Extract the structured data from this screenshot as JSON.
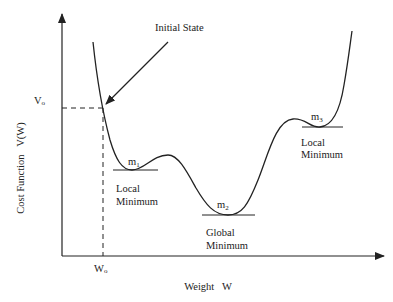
{
  "axes": {
    "y_label": "Cost Function   V(W)",
    "x_label": "Weight   W",
    "y_tick": "V",
    "y_tick_sub": "o",
    "x_tick": "W",
    "x_tick_sub": "o"
  },
  "annotations": {
    "initial_state": "Initial State",
    "m1": {
      "name": "m",
      "sub": "1",
      "line1": "Local",
      "line2": "Minimum"
    },
    "m2": {
      "name": "m",
      "sub": "2",
      "line1": "Global",
      "line2": "Minimum"
    },
    "m3": {
      "name": "m",
      "sub": "3",
      "line1": "Local",
      "line2": "Minimum"
    }
  },
  "colors": {
    "ink": "#222222",
    "background": "#ffffff"
  }
}
